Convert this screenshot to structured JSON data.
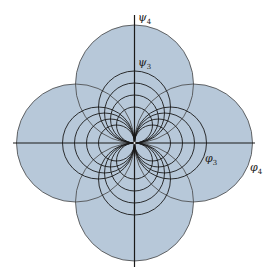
{
  "diagram": {
    "type": "potential-flow-doublet-pattern",
    "origin": {
      "x": 134.5,
      "y": 143
    },
    "fill_color": "#b7c8d9",
    "line_color": "#1a1a1a",
    "outer_circles": [
      {
        "name": "top",
        "cx": 134.5,
        "cy": 84,
        "r": 59
      },
      {
        "name": "bottom",
        "cx": 134.5,
        "cy": 202,
        "r": 59
      },
      {
        "name": "left",
        "cx": 75.5,
        "cy": 143,
        "r": 59
      },
      {
        "name": "right",
        "cx": 193.5,
        "cy": 143,
        "r": 59
      }
    ],
    "inner_diameters": [
      36,
      48,
      60,
      72
    ],
    "axes": {
      "horizontal": {
        "x1": 13,
        "x2": 255,
        "y": 143
      },
      "vertical": {
        "x": 134.5,
        "y1": 15,
        "y2": 267
      }
    },
    "labels": {
      "psi4": {
        "base": "ψ",
        "sub": "4"
      },
      "psi3": {
        "base": "ψ",
        "sub": "3"
      },
      "phi3": {
        "base": "φ",
        "sub": "3"
      },
      "phi4": {
        "base": "φ",
        "sub": "4"
      }
    }
  }
}
